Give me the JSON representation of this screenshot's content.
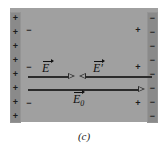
{
  "figure": {
    "caption": "(c)",
    "background_color": "#ffffff",
    "slab_color": "#a0a0a0",
    "plate_color": "#8a8a8a",
    "arrow_color": "#2b2b2b"
  },
  "plates": {
    "left": {
      "polarity": "positive",
      "sign_glyph": "+",
      "count": 8,
      "signs": [
        "+",
        "+",
        "+",
        "+",
        "+",
        "+",
        "+",
        "+"
      ]
    },
    "right": {
      "polarity": "negative",
      "sign_glyph": "−",
      "count": 8,
      "signs": [
        "−",
        "−",
        "−",
        "−",
        "−",
        "−",
        "−",
        "−"
      ]
    }
  },
  "induced_charges": {
    "left": {
      "polarity": "negative",
      "sign_glyph": "−",
      "count": 3,
      "signs": [
        "−",
        "−",
        "−"
      ]
    },
    "right": {
      "polarity": "positive",
      "sign_glyph": "+",
      "count": 3,
      "signs": [
        "+",
        "+",
        "+"
      ]
    }
  },
  "vectors": [
    {
      "id": "E",
      "symbol": "E",
      "subscript": "",
      "prime": "",
      "label": "E",
      "direction": "right",
      "row": "upper",
      "position": "left"
    },
    {
      "id": "E-prime",
      "symbol": "E",
      "subscript": "",
      "prime": "′",
      "label": "E′",
      "direction": "left",
      "row": "upper",
      "position": "right"
    },
    {
      "id": "E0",
      "symbol": "E",
      "subscript": "0",
      "prime": "",
      "label": "E0",
      "direction": "right",
      "row": "lower",
      "position": "center"
    }
  ]
}
